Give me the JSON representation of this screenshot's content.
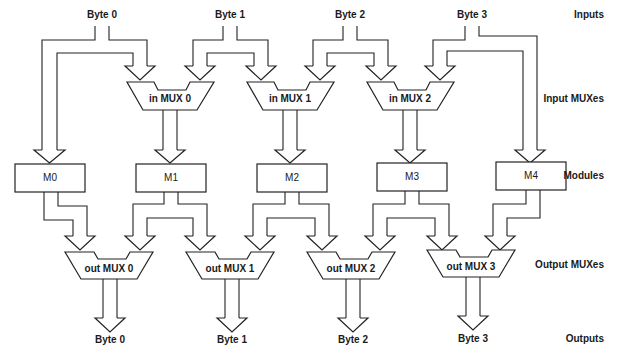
{
  "diagram": {
    "row_labels": {
      "inputs": "Inputs",
      "input_muxes": "Input MUXes",
      "modules": "Modules",
      "output_muxes": "Output MUXes",
      "outputs": "Outputs"
    },
    "inputs": [
      {
        "label": "Byte 0"
      },
      {
        "label": "Byte 1"
      },
      {
        "label": "Byte 2"
      },
      {
        "label": "Byte 3"
      }
    ],
    "input_muxes": [
      {
        "label": "in MUX 0"
      },
      {
        "label": "in MUX 1"
      },
      {
        "label": "in MUX 2"
      }
    ],
    "modules": [
      {
        "label": "M0"
      },
      {
        "label": "M1"
      },
      {
        "label": "M2"
      },
      {
        "label": "M3"
      },
      {
        "label": "M4"
      }
    ],
    "output_muxes": [
      {
        "label": "out MUX 0"
      },
      {
        "label": "out MUX 1"
      },
      {
        "label": "out MUX 2"
      },
      {
        "label": "out MUX 3"
      }
    ],
    "outputs": [
      {
        "label": "Byte 0"
      },
      {
        "label": "Byte 1"
      },
      {
        "label": "Byte 2"
      },
      {
        "label": "Byte 3"
      }
    ],
    "connections": {
      "input_to_module_direct": [
        [
          "Byte 0",
          "M0"
        ],
        [
          "Byte 3",
          "M4"
        ]
      ],
      "input_to_in_mux": [
        [
          "Byte 0",
          "in MUX 0"
        ],
        [
          "Byte 1",
          "in MUX 0"
        ],
        [
          "Byte 1",
          "in MUX 1"
        ],
        [
          "Byte 2",
          "in MUX 1"
        ],
        [
          "Byte 2",
          "in MUX 2"
        ],
        [
          "Byte 3",
          "in MUX 2"
        ]
      ],
      "in_mux_to_module": [
        [
          "in MUX 0",
          "M1"
        ],
        [
          "in MUX 1",
          "M2"
        ],
        [
          "in MUX 2",
          "M3"
        ]
      ],
      "module_to_out_mux": [
        [
          "M0",
          "out MUX 0"
        ],
        [
          "M1",
          "out MUX 0"
        ],
        [
          "M1",
          "out MUX 1"
        ],
        [
          "M2",
          "out MUX 1"
        ],
        [
          "M2",
          "out MUX 2"
        ],
        [
          "M3",
          "out MUX 2"
        ],
        [
          "M3",
          "out MUX 3"
        ],
        [
          "M4",
          "out MUX 3"
        ]
      ],
      "out_mux_to_output": [
        [
          "out MUX 0",
          "Byte 0"
        ],
        [
          "out MUX 1",
          "Byte 1"
        ],
        [
          "out MUX 2",
          "Byte 2"
        ],
        [
          "out MUX 3",
          "Byte 3"
        ]
      ]
    }
  }
}
